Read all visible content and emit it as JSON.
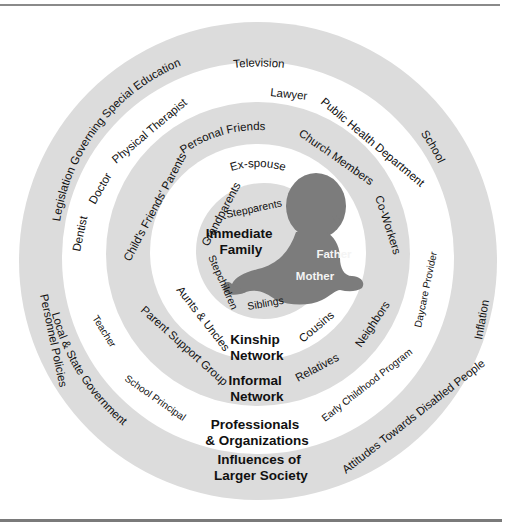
{
  "figure": {
    "caption_fragment": "",
    "colors": {
      "ring_gray": "#dcdcdc",
      "ring_white": "#ffffff",
      "baby_silhouette": "#7c7c7c",
      "text": "#111111",
      "baby_text": "#f4f4f4"
    }
  },
  "rings": {
    "larger_society": {
      "title_line1": "Influences of",
      "title_line2": "Larger Society",
      "items": {
        "television": "Television",
        "legislation": "Legislation Governing Special Education",
        "school": "School",
        "personnel_policies": "Personnel Policies",
        "inflation": "Inflation",
        "local_state_gov": "Local & State Government",
        "attitudes": "Attitudes Towards Disabled People"
      }
    },
    "professionals": {
      "title_line1": "Professionals",
      "title_line2": "& Organizations",
      "items": {
        "lawyer": "Lawyer",
        "public_health": "Public Health Department",
        "physical_therapist": "Physical Therapist",
        "doctor": "Doctor",
        "dentist": "Dentist",
        "teacher": "Teacher",
        "school_principal": "School Principal",
        "daycare_provider": "Daycare Provider",
        "early_childhood": "Early Childhood Program"
      }
    },
    "informal": {
      "title_line1": "Informal",
      "title_line2": "Network",
      "items": {
        "personal_friends": "Personal Friends",
        "church_members": "Church Members",
        "childs_friends_parents": "Child's Friends' Parents",
        "co_workers": "Co-Workers",
        "parent_support": "Parent Support Group",
        "neighbors": "Neighbors",
        "relatives": "Relatives"
      }
    },
    "kinship": {
      "title_line1": "Kinship",
      "title_line2": "Network",
      "items": {
        "ex_spouse": "Ex-spouse",
        "grandparents": "Grandparents",
        "aunts_uncles": "Aunts & Uncles",
        "cousins": "Cousins"
      }
    },
    "immediate": {
      "title_line1": "Immediate",
      "title_line2": "Family",
      "items": {
        "stepparents": "Stepparents",
        "stepchildren": "Stepchildren",
        "siblings": "Siblings",
        "father": "Father",
        "mother": "Mother"
      }
    }
  }
}
